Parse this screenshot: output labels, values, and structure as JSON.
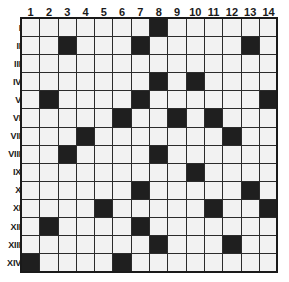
{
  "grid": {
    "title": "nonogram-grid",
    "column_headers": [
      "1",
      "2",
      "3",
      "4",
      "5",
      "6",
      "7",
      "8",
      "9",
      "10",
      "11",
      "12",
      "13",
      "14"
    ],
    "row_headers": [
      "I",
      "II",
      "III",
      "IV",
      "V",
      "VI",
      "VII",
      "VIII",
      "IX",
      "X",
      "XI",
      "XII",
      "XIII",
      "XIV"
    ],
    "columns": 14,
    "rows": 14,
    "colors": {
      "filled": "#1f1f1f",
      "empty": "#f2f2f2",
      "gridline": "#2b2b2b",
      "border": "#1a1a1a",
      "background": "#ffffff",
      "text": "#1a1a1a"
    },
    "filled_cells": {
      "I": [
        8
      ],
      "II": [
        3,
        7,
        13
      ],
      "III": [],
      "IV": [
        8,
        10
      ],
      "V": [
        2,
        7,
        14
      ],
      "VI": [
        6,
        9,
        11
      ],
      "VII": [
        4,
        12
      ],
      "VIII": [
        3,
        8
      ],
      "IX": [
        10
      ],
      "X": [
        7,
        13
      ],
      "XI": [
        5,
        11,
        14
      ],
      "XII": [
        2,
        7
      ],
      "XIII": [
        8,
        12
      ],
      "XIV": [
        1,
        6
      ]
    },
    "cells_matrix": [
      [
        0,
        0,
        0,
        0,
        0,
        0,
        0,
        1,
        0,
        0,
        0,
        0,
        0,
        0
      ],
      [
        0,
        0,
        1,
        0,
        0,
        0,
        1,
        0,
        0,
        0,
        0,
        0,
        1,
        0
      ],
      [
        0,
        0,
        0,
        0,
        0,
        0,
        0,
        0,
        0,
        0,
        0,
        0,
        0,
        0
      ],
      [
        0,
        0,
        0,
        0,
        0,
        0,
        0,
        1,
        0,
        1,
        0,
        0,
        0,
        0
      ],
      [
        0,
        1,
        0,
        0,
        0,
        0,
        1,
        0,
        0,
        0,
        0,
        0,
        0,
        1
      ],
      [
        0,
        0,
        0,
        0,
        0,
        1,
        0,
        0,
        1,
        0,
        1,
        0,
        0,
        0
      ],
      [
        0,
        0,
        0,
        1,
        0,
        0,
        0,
        0,
        0,
        0,
        0,
        1,
        0,
        0
      ],
      [
        0,
        0,
        1,
        0,
        0,
        0,
        0,
        1,
        0,
        0,
        0,
        0,
        0,
        0
      ],
      [
        0,
        0,
        0,
        0,
        0,
        0,
        0,
        0,
        0,
        1,
        0,
        0,
        0,
        0
      ],
      [
        0,
        0,
        0,
        0,
        0,
        0,
        1,
        0,
        0,
        0,
        0,
        0,
        1,
        0
      ],
      [
        0,
        0,
        0,
        0,
        1,
        0,
        0,
        0,
        0,
        0,
        1,
        0,
        0,
        1
      ],
      [
        0,
        1,
        0,
        0,
        0,
        0,
        1,
        0,
        0,
        0,
        0,
        0,
        0,
        0
      ],
      [
        0,
        0,
        0,
        0,
        0,
        0,
        0,
        1,
        0,
        0,
        0,
        1,
        0,
        0
      ],
      [
        1,
        0,
        0,
        0,
        0,
        1,
        0,
        0,
        0,
        0,
        0,
        0,
        0,
        0
      ]
    ]
  }
}
